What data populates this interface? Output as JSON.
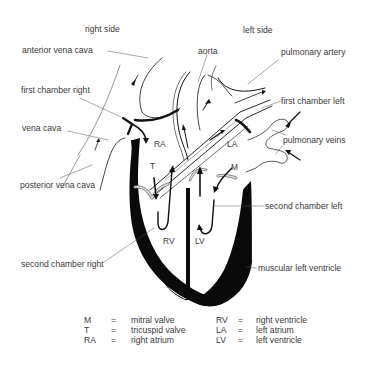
{
  "diagram": {
    "side_labels": {
      "right": "right side",
      "left": "left side"
    },
    "callouts": {
      "anterior_vena_cava": "anterior vena cava",
      "first_chamber_right": "first chamber right",
      "vena_cava": "vena cava",
      "posterior_vena_cava": "posterior vena cava",
      "second_chamber_right": "second chamber right",
      "aorta": "aorta",
      "pulmonary_artery": "pulmonary artery",
      "first_chamber_left": "first chamber left",
      "pulmonary_veins": "pulmonary veins",
      "second_chamber_left": "second chamber left",
      "muscular_left_ventricle": "muscular left ventricle"
    },
    "inner_labels": {
      "RA": "RA",
      "T": "T",
      "LA": "LA",
      "M": "M",
      "RV": "RV",
      "LV": "LV"
    },
    "legend": [
      {
        "abbr": "M",
        "eq": "=",
        "text": "mitral valve",
        "abbr2": "RV",
        "eq2": "=",
        "text2": "right ventricle"
      },
      {
        "abbr": "T",
        "eq": "=",
        "text": "tricuspid valve",
        "abbr2": "LA",
        "eq2": "=",
        "text2": "left atrium"
      },
      {
        "abbr": "RA",
        "eq": "=",
        "text": "right atrium",
        "abbr2": "LV",
        "eq2": "=",
        "text2": "left ventricle"
      }
    ],
    "colors": {
      "ink": "#111111",
      "text": "#3a3a3a",
      "leader": "#555555",
      "valve_fill": "#c8c8c8",
      "background": "#ffffff"
    }
  }
}
